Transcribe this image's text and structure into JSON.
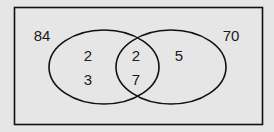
{
  "diagram": {
    "type": "venn",
    "universal_label": "84",
    "set_b_outside_label": "70",
    "regions": {
      "left_only_top": "2",
      "left_only_bottom": "3",
      "intersection_top": "2",
      "intersection_bottom": "7",
      "right_only": "5"
    },
    "colors": {
      "background": "#e6e6e6",
      "stroke": "#111111",
      "text": "#1a1a1a"
    }
  }
}
